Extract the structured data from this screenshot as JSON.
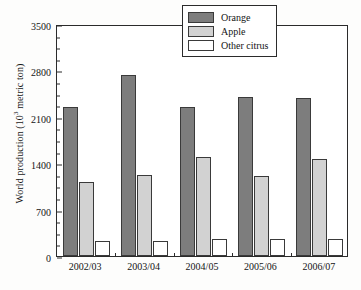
{
  "chart_data": {
    "type": "bar",
    "title": "",
    "xlabel": "",
    "ylabel": "World production (10³ metric ton)",
    "ylabel_main": "World production (10",
    "ylabel_sup": "3",
    "ylabel_tail": " metric ton)",
    "categories": [
      "2002/03",
      "2003/04",
      "2004/05",
      "2005/06",
      "2006/07"
    ],
    "series": [
      {
        "name": "Orange",
        "color": "#7d7d7d",
        "values": [
          2250,
          2730,
          2250,
          2400,
          2390
        ]
      },
      {
        "name": "Apple",
        "color": "#d2d2d2",
        "values": [
          1110,
          1220,
          1500,
          1210,
          1460
        ]
      },
      {
        "name": "Other citrus",
        "color": "#ffffff",
        "values": [
          220,
          220,
          250,
          250,
          250
        ]
      }
    ],
    "ylim": [
      0,
      3500
    ],
    "yticks": [
      0,
      700,
      1400,
      2100,
      2800,
      3500
    ],
    "ytick_labels": [
      "0",
      "700",
      "1400",
      "2100",
      "2800",
      "3500"
    ],
    "yminor_step": 175,
    "grid": false,
    "legend_position": "top-right",
    "frame": true
  },
  "legend": {
    "entries": [
      {
        "label": "Orange"
      },
      {
        "label": "Apple"
      },
      {
        "label": "Other citrus"
      }
    ]
  }
}
